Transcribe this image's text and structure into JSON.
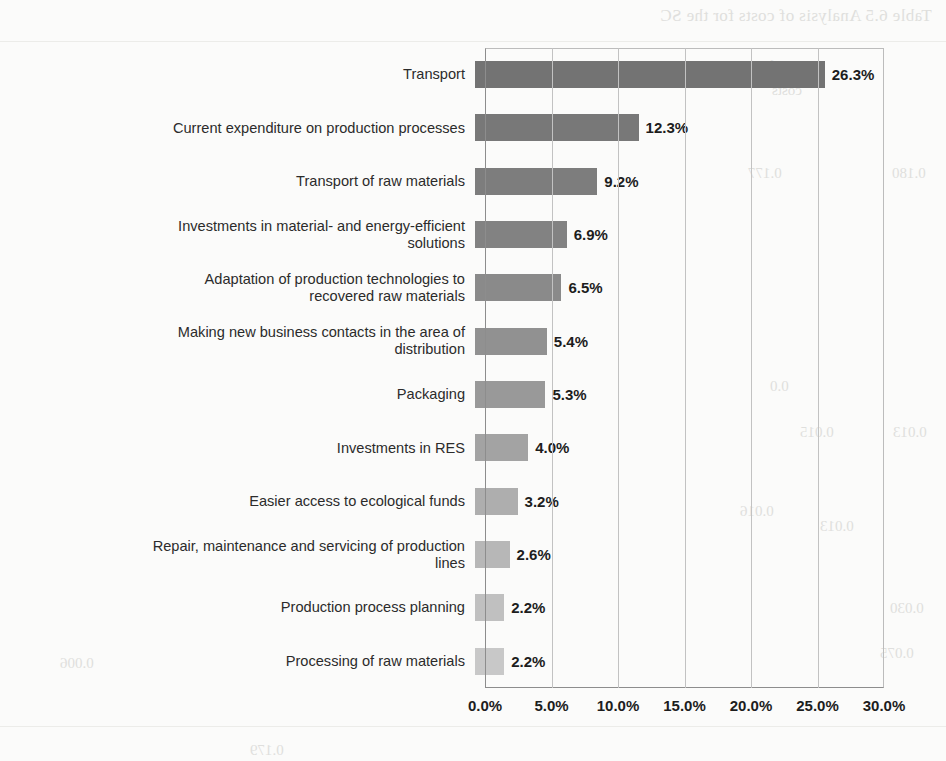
{
  "chart_data": {
    "type": "bar",
    "orientation": "horizontal",
    "title": "",
    "xlabel": "",
    "ylabel": "",
    "xlim": [
      0,
      30
    ],
    "grid": true,
    "legend": false,
    "tick_labels": [
      "0.0%",
      "5.0%",
      "10.0%",
      "15.0%",
      "20.0%",
      "25.0%",
      "30.0%"
    ],
    "tick_values": [
      0,
      5,
      10,
      15,
      20,
      25,
      30
    ],
    "categories": [
      "Transport",
      "Current expenditure on production processes",
      "Transport of raw materials",
      "Investments in material- and energy-efficient\nsolutions",
      "Adaptation of production technologies to\nrecovered raw materials",
      "Making new business contacts in the area of\ndistribution",
      "Packaging",
      "Investments in RES",
      "Easier access to ecological funds",
      "Repair, maintenance and servicing of production\nlines",
      "Production process planning",
      "Processing of raw materials"
    ],
    "values": [
      26.3,
      12.3,
      9.2,
      6.9,
      6.5,
      5.4,
      5.3,
      4.0,
      3.2,
      2.6,
      2.2,
      2.2
    ],
    "value_labels": [
      "26.3%",
      "12.3%",
      "9.2%",
      "6.9%",
      "6.5%",
      "5.4%",
      "5.3%",
      "4.0%",
      "3.2%",
      "2.6%",
      "2.2%",
      "2.2%"
    ],
    "bar_colors": [
      "#737373",
      "#787878",
      "#7d7d7d",
      "#828282",
      "#8a8a8a",
      "#919191",
      "#999999",
      "#a3a3a3",
      "#aeaeae",
      "#b7b7b7",
      "#c0c0c0",
      "#c8c8c8"
    ]
  },
  "background": {
    "bleed_title": "Table 6.5 Analysis of costs for the SC",
    "bleed_cells": [
      "Specific",
      "costs",
      "0.177",
      "0.180",
      "0.0",
      "0.015",
      "0.013",
      "0.016",
      "0.013",
      "0.030",
      "0.075",
      "0.006",
      "0.179",
      "0.081",
      "0.084",
      "0.070",
      "0.003"
    ]
  }
}
